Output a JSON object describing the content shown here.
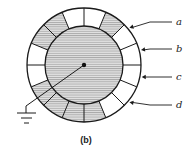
{
  "figure": {
    "caption": "(b)",
    "labels": [
      {
        "id": "a",
        "text": "a",
        "y": 25,
        "target_angle": -40
      },
      {
        "id": "b",
        "text": "b",
        "y": 52,
        "target_angle": -15
      },
      {
        "id": "c",
        "text": "c",
        "y": 80,
        "target_angle": 12
      },
      {
        "id": "d",
        "text": "d",
        "y": 108,
        "target_angle": 40
      }
    ],
    "geometry": {
      "center": [
        84,
        65
      ],
      "outer_radius": 57,
      "inner_radius": 39,
      "segment_count": 16
    },
    "segments_shaded": [
      false,
      true,
      true,
      false,
      false,
      true,
      false,
      false,
      false,
      false,
      false,
      true,
      true,
      true,
      true,
      false
    ],
    "colors": {
      "stroke": "#1a1a1a",
      "hatch_fill": "#d8d8d8",
      "hatch_line": "#8a8a8a",
      "background": "#ffffff"
    },
    "ground_symbol": "ground-icon"
  }
}
